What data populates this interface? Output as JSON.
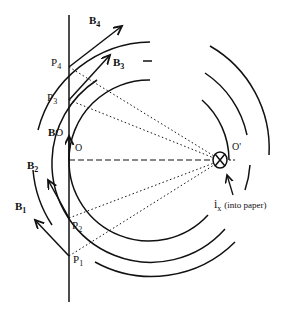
{
  "diagram": {
    "current": {
      "label": "i",
      "subscript": "x",
      "note": "(into paper)",
      "symbol": "cross-circle"
    },
    "points": [
      {
        "label": "P",
        "sub": "1"
      },
      {
        "label": "P",
        "sub": "2"
      },
      {
        "label": "P",
        "sub": "3"
      },
      {
        "label": "P",
        "sub": "4"
      }
    ],
    "vectors": [
      {
        "label": "B",
        "sub": "1"
      },
      {
        "label": "B",
        "sub": "2"
      },
      {
        "label": "B",
        "sub": "3"
      },
      {
        "label": "B",
        "sub": "4"
      },
      {
        "label": "B",
        "sub": "O"
      }
    ],
    "origin_label": "O",
    "center_label": "O'"
  }
}
